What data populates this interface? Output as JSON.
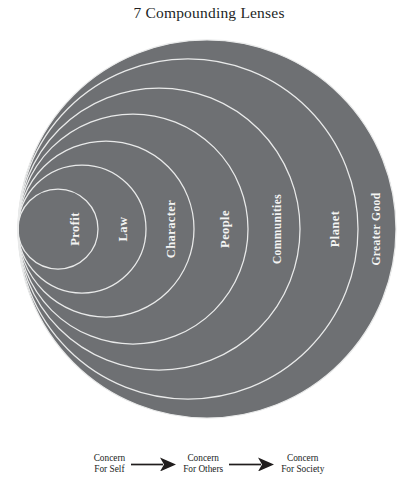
{
  "title": "7 Compounding Lenses",
  "colors": {
    "circle_fill": "#6e7073",
    "circle_stroke": "#e9eaea",
    "label_text": "#f4f4f3",
    "title_text": "#221f1f",
    "legend_text": "#201d1d",
    "background": "#ffffff"
  },
  "diagram": {
    "type": "nested-tangent-circles",
    "orientation": "left-tangent, growing rightward",
    "label_rotation_degrees": -90,
    "lenses": [
      {
        "index": 1,
        "label": "Profit",
        "radius": 40,
        "scope": "self"
      },
      {
        "index": 2,
        "label": "Law",
        "radius": 64,
        "scope": "self"
      },
      {
        "index": 3,
        "label": "Character",
        "radius": 88,
        "scope": "self"
      },
      {
        "index": 4,
        "label": "People",
        "radius": 115,
        "scope": "others"
      },
      {
        "index": 5,
        "label": "Communities",
        "radius": 141,
        "scope": "others"
      },
      {
        "index": 6,
        "label": "Planet",
        "radius": 170,
        "scope": "society"
      },
      {
        "index": 7,
        "label": "Greater Good",
        "radius": 189,
        "scope": "society"
      }
    ]
  },
  "legend": {
    "items": [
      {
        "line1": "Concern",
        "line2": "For Self"
      },
      {
        "line1": "Concern",
        "line2": "For Others"
      },
      {
        "line1": "Concern",
        "line2": "For Society"
      }
    ],
    "arrow_icon": "right-arrow-icon"
  }
}
